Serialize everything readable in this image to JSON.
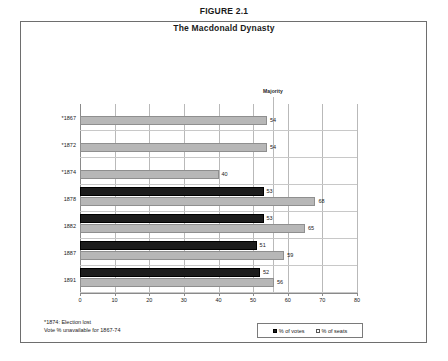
{
  "figure": {
    "title": "FIGURE 2.1",
    "subtitle": "The Macdonald Dynasty"
  },
  "annotations": {
    "majority": "Majority"
  },
  "footnote": {
    "line1": "*1874: Election lost",
    "line2": "Vote % unavailable for 1867-74"
  },
  "legend": {
    "items": [
      {
        "label": "% of votes",
        "color": "#1c1c1c"
      },
      {
        "label": "% of seats",
        "color": "#b7b7b7"
      }
    ]
  },
  "chart_data": {
    "type": "bar",
    "orientation": "horizontal",
    "title": "The Macdonald Dynasty",
    "subtitle": "FIGURE 2.1",
    "xlabel": "",
    "ylabel": "",
    "xlim": [
      0,
      80
    ],
    "xticks": [
      0,
      10,
      20,
      30,
      40,
      50,
      60,
      70,
      80
    ],
    "grid": true,
    "legend_position": "bottom-right",
    "categories": [
      "*1867",
      "*1872",
      "*1874",
      "1878",
      "1882",
      "1887",
      "1891"
    ],
    "series": [
      {
        "name": "% of votes",
        "color": "#1c1c1c",
        "values": [
          null,
          null,
          null,
          53,
          53,
          51,
          52
        ]
      },
      {
        "name": "% of seats",
        "color": "#b7b7b7",
        "values": [
          54,
          54,
          40,
          68,
          65,
          59,
          56
        ]
      }
    ],
    "reference_line": {
      "label": "Majority",
      "value": 50
    },
    "notes": [
      "*1874: Election lost",
      "Vote % unavailable for 1867-74"
    ]
  }
}
